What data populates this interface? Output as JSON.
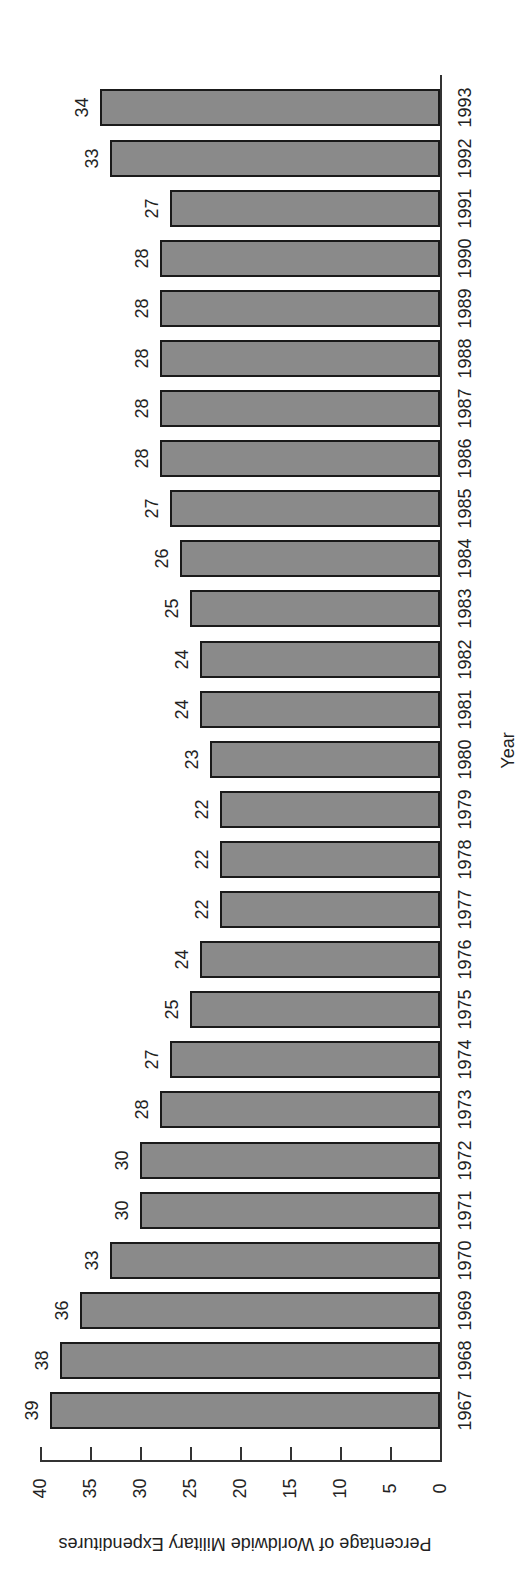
{
  "chart_data": {
    "type": "bar",
    "orientation": "rotated-90-clockwise (bars extend leftward from baseline on right)",
    "title": "",
    "xlabel": "Year",
    "ylabel": "Percentage of Worldwide Military Expenditures",
    "ylim": [
      0,
      40
    ],
    "yticks": [
      0,
      5,
      10,
      15,
      20,
      25,
      30,
      35,
      40
    ],
    "grid": false,
    "legend": null,
    "categories": [
      "1967",
      "1968",
      "1969",
      "1970",
      "1971",
      "1972",
      "1973",
      "1974",
      "1975",
      "1976",
      "1977",
      "1978",
      "1979",
      "1980",
      "1981",
      "1982",
      "1983",
      "1984",
      "1985",
      "1986",
      "1987",
      "1988",
      "1989",
      "1990",
      "1991",
      "1992",
      "1993"
    ],
    "values": [
      39,
      38,
      36,
      33,
      30,
      30,
      28,
      27,
      25,
      24,
      22,
      22,
      22,
      23,
      24,
      24,
      25,
      26,
      27,
      28,
      28,
      28,
      28,
      28,
      27,
      33,
      34
    ],
    "bar_color": "#8a8a8a",
    "bar_edge_color": "#1a1a1a"
  }
}
